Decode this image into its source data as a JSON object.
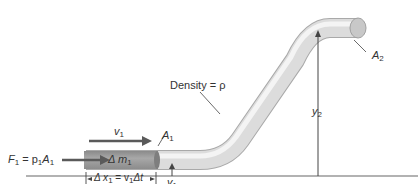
{
  "labels": {
    "force": "F",
    "force_sub": "1",
    "force_eq": " = p",
    "force_p_sub": "1",
    "force_A": "A",
    "force_A_sub": "1",
    "velocity": "v",
    "velocity_sub": "1",
    "area1": "A",
    "area1_sub": "1",
    "mass": "Δ m",
    "mass_sub": "1",
    "dx_pre": "Δ x",
    "dx_sub1": "1",
    "dx_eq": " = v",
    "dx_sub2": "1",
    "dx_post": "Δt",
    "height1": "y",
    "height1_sub": "1",
    "height2": "y",
    "height2_sub": "2",
    "area2": "A",
    "area2_sub": "2",
    "density": "Density = ρ"
  },
  "colors": {
    "pipe_light": "#ececec",
    "pipe_mid": "#d2d2d2",
    "pipe_dark": "#b8b8b8",
    "fluid_element": "#9a9a9a",
    "arrow": "#5a5a5a",
    "line": "#444444",
    "ground": "#666666"
  }
}
